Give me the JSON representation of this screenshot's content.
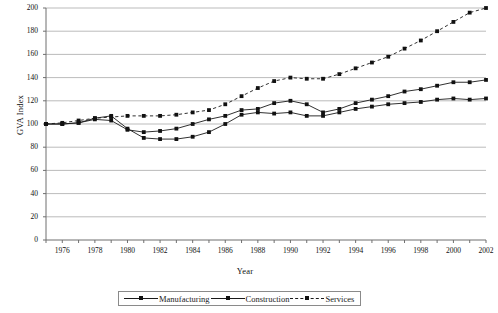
{
  "chart_data": {
    "type": "line",
    "title": "",
    "xlabel": "Year",
    "ylabel": "GVA Index",
    "xlim": [
      1975,
      2002
    ],
    "ylim": [
      0,
      200
    ],
    "ytick_step": 20,
    "yticks": [
      0,
      20,
      40,
      60,
      80,
      100,
      120,
      140,
      160,
      180,
      200
    ],
    "xticks": [
      1975,
      1976,
      1977,
      1978,
      1979,
      1980,
      1981,
      1982,
      1983,
      1984,
      1985,
      1986,
      1987,
      1988,
      1989,
      1990,
      1991,
      1992,
      1993,
      1994,
      1995,
      1996,
      1997,
      1998,
      1999,
      2000,
      2001,
      2002
    ],
    "xtick_labels": [
      "",
      "1976",
      "",
      "1978",
      "",
      "1980",
      "",
      "1982",
      "",
      "1984",
      "",
      "1986",
      "",
      "1988",
      "",
      "1990",
      "",
      "1992",
      "",
      "1994",
      "",
      "1996",
      "",
      "1998",
      "",
      "2000",
      "",
      "2002"
    ],
    "grid": "horizontal",
    "legend_position": "bottom",
    "x": [
      1975,
      1976,
      1977,
      1978,
      1979,
      1980,
      1981,
      1982,
      1983,
      1984,
      1985,
      1986,
      1987,
      1988,
      1989,
      1990,
      1991,
      1992,
      1993,
      1994,
      1995,
      1996,
      1997,
      1998,
      1999,
      2000,
      2001,
      2002
    ],
    "series": [
      {
        "name": "Manufacturing",
        "style": "solid",
        "marker": "square",
        "values": [
          100,
          100,
          101,
          104,
          103,
          95,
          93,
          94,
          96,
          100,
          104,
          107,
          112,
          113,
          118,
          120,
          117,
          110,
          113,
          118,
          121,
          124,
          128,
          130,
          133,
          136,
          136,
          138
        ]
      },
      {
        "name": "Construction",
        "style": "solid",
        "marker": "square",
        "values": [
          100,
          100,
          101,
          105,
          107,
          96,
          88,
          87,
          87,
          89,
          93,
          100,
          108,
          110,
          109,
          110,
          107,
          107,
          110,
          113,
          115,
          117,
          118,
          119,
          121,
          122,
          121,
          122
        ]
      },
      {
        "name": "Services",
        "style": "dashed",
        "marker": "square",
        "values": [
          100,
          101,
          103,
          105,
          106,
          107,
          107,
          107,
          108,
          110,
          112,
          117,
          124,
          131,
          137,
          140,
          139,
          139,
          143,
          148,
          153,
          158,
          165,
          172,
          180,
          188,
          196,
          200
        ]
      }
    ]
  },
  "legend": {
    "items": [
      {
        "label": "Manufacturing"
      },
      {
        "label": "Construction"
      },
      {
        "label": "Services"
      }
    ]
  }
}
